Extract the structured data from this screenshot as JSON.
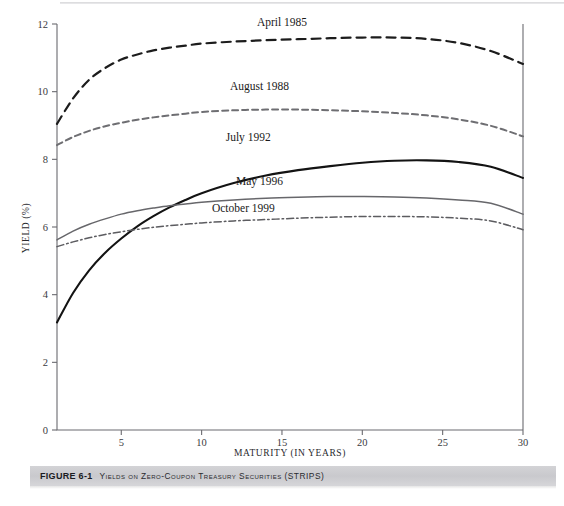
{
  "figure": {
    "caption_number": "FIGURE 6-1",
    "caption_title": "Yields on Zero-Coupon Treasury Securities (STRIPS)"
  },
  "chart_data": {
    "type": "line",
    "title": "",
    "xlabel": "MATURITY (IN YEARS)",
    "ylabel": "YIELD (%)",
    "xlim": [
      1,
      30
    ],
    "ylim": [
      0,
      12
    ],
    "xticks": [
      5,
      10,
      15,
      20,
      25,
      30
    ],
    "yticks": [
      0,
      2,
      4,
      6,
      8,
      10,
      12
    ],
    "grid": false,
    "legend_position": "inline-annotations",
    "x": [
      1,
      2,
      3,
      4,
      5,
      6,
      7,
      8,
      9,
      10,
      12,
      14,
      16,
      18,
      20,
      22,
      24,
      26,
      28,
      30
    ],
    "series": [
      {
        "name": "April 1985",
        "color": "#1c1c1c",
        "style": "dashed",
        "dash": "9,6",
        "width": 2.2,
        "label_x": 15.0,
        "label_y": 11.95,
        "values": [
          9.05,
          9.8,
          10.35,
          10.7,
          10.95,
          11.1,
          11.22,
          11.3,
          11.36,
          11.42,
          11.48,
          11.52,
          11.55,
          11.58,
          11.6,
          11.6,
          11.56,
          11.44,
          11.2,
          10.82
        ]
      },
      {
        "name": "August 1988",
        "color": "#6e6e72",
        "style": "dashed",
        "dash": "6,4",
        "width": 2.0,
        "label_x": 13.6,
        "label_y": 10.05,
        "values": [
          8.42,
          8.66,
          8.84,
          8.98,
          9.08,
          9.17,
          9.24,
          9.3,
          9.35,
          9.4,
          9.45,
          9.47,
          9.47,
          9.45,
          9.42,
          9.37,
          9.3,
          9.18,
          8.99,
          8.68
        ]
      },
      {
        "name": "July 1992",
        "color": "#131313",
        "style": "solid",
        "dash": "",
        "width": 2.1,
        "label_x": 12.9,
        "label_y": 8.55,
        "values": [
          3.18,
          4.05,
          4.72,
          5.24,
          5.66,
          6.02,
          6.32,
          6.58,
          6.8,
          7.0,
          7.3,
          7.52,
          7.68,
          7.8,
          7.9,
          7.96,
          7.97,
          7.92,
          7.78,
          7.45
        ]
      },
      {
        "name": "May 1996",
        "color": "#67676b",
        "style": "solid",
        "dash": "",
        "width": 1.5,
        "label_x": 13.6,
        "label_y": 7.25,
        "values": [
          5.62,
          5.88,
          6.08,
          6.24,
          6.38,
          6.48,
          6.56,
          6.63,
          6.68,
          6.73,
          6.8,
          6.85,
          6.88,
          6.9,
          6.9,
          6.89,
          6.86,
          6.8,
          6.7,
          6.38
        ]
      },
      {
        "name": "October 1999",
        "color": "#5c5c60",
        "style": "dash-dot",
        "dash": "7,3,1.5,3",
        "width": 1.5,
        "label_x": 12.6,
        "label_y": 6.45,
        "values": [
          5.42,
          5.56,
          5.68,
          5.78,
          5.86,
          5.93,
          5.99,
          6.04,
          6.08,
          6.12,
          6.18,
          6.22,
          6.26,
          6.29,
          6.31,
          6.31,
          6.3,
          6.26,
          6.18,
          5.92
        ]
      }
    ]
  }
}
